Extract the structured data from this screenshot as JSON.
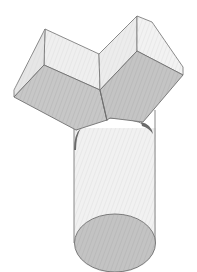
{
  "figure": {
    "caption_partial": "",
    "colors": {
      "background": "#ffffff",
      "outline": "#6e6e6e",
      "light_face": "#ececec",
      "mid_face": "#c9c9c9",
      "dark_face": "#b9b9b9",
      "cylinder_body": "#f0f0f0",
      "cylinder_base": "#c2c2c2",
      "shadow": "#7a7a7a",
      "hatch": "#d8d8d8"
    },
    "parts": [
      {
        "name": "left-box",
        "type": "rectangular-prism"
      },
      {
        "name": "right-box",
        "type": "rectangular-prism"
      },
      {
        "name": "cylinder",
        "type": "cylinder"
      }
    ]
  }
}
